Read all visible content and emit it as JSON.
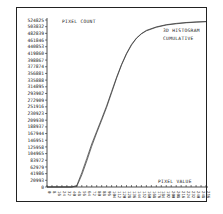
{
  "chart_data": {
    "type": "line",
    "title": "",
    "ylabel": "PIXEL COUNT",
    "xlabel": "PIXEL VALUE",
    "annotation": [
      "3D HISTOGRAM",
      "CUMULATIVE"
    ],
    "y_ticks": [
      0,
      20993,
      41986,
      62979,
      83972,
      104965,
      125958,
      146951,
      167944,
      188937,
      209930,
      230923,
      251916,
      272909,
      293902,
      314895,
      335888,
      356881,
      377874,
      398867,
      419860,
      440853,
      461846,
      482839,
      503832,
      524825
    ],
    "x_ticks": [
      0,
      8,
      16,
      24,
      32,
      40,
      48,
      56,
      64,
      72,
      80,
      88,
      96,
      104,
      112,
      120,
      128,
      136,
      144,
      152,
      160,
      168,
      176,
      184,
      192,
      200,
      208,
      216,
      224,
      232,
      240,
      248,
      256
    ],
    "ylim": [
      0,
      524825
    ],
    "xlim": [
      0,
      256
    ],
    "grid": false,
    "legend": "none",
    "series": [
      {
        "name": "cumulative histogram (curve A)",
        "x": [
          0,
          40,
          48,
          56,
          64,
          72,
          80,
          88,
          96,
          104,
          112,
          120,
          128,
          136,
          144,
          152,
          160,
          176,
          192,
          208,
          224,
          240,
          256
        ],
        "values": [
          0,
          0,
          5000,
          45000,
          90000,
          135000,
          175000,
          215000,
          255000,
          300000,
          345000,
          385000,
          420000,
          448000,
          468000,
          482000,
          492000,
          503000,
          510000,
          514000,
          517000,
          519000,
          520000
        ]
      },
      {
        "name": "cumulative histogram (curve B)",
        "x": [
          0,
          40,
          48,
          56,
          64,
          72,
          80,
          88,
          96,
          104,
          112,
          120,
          128,
          136,
          144,
          152,
          160,
          176,
          192,
          208,
          224,
          240,
          256
        ],
        "values": [
          0,
          0,
          2000,
          38000,
          82000,
          128000,
          170000,
          210000,
          250000,
          296000,
          342000,
          383000,
          418000,
          446000,
          467000,
          481000,
          491000,
          502000,
          509000,
          513000,
          516000,
          518000,
          519500
        ]
      }
    ]
  },
  "labels": {
    "y_axis_title": "PIXEL COUNT",
    "x_axis_title": "PIXEL VALUE",
    "annotation_line1": "3D HISTOGRAM",
    "annotation_line2": "CUMULATIVE"
  }
}
